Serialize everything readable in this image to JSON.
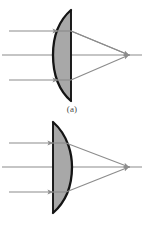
{
  "figure": {
    "background_color": "#ffffff",
    "width": 144,
    "height": 227,
    "colors": {
      "lens_fill": "#a8a8a8",
      "lens_outline": "#1a1a1a",
      "ray_line": "#8c8c8c",
      "axis_line": "#8c8c8c",
      "caption_text": "#4a4a4a"
    },
    "panels": [
      {
        "id": "a",
        "caption": "(a)",
        "lens_type": "plano-convex",
        "curved_side": "left",
        "flat_side": "right",
        "description": "Parallel rays enter the curved (convex) surface on the left and exit through the flat surface on the right, converging to a focal point on the optical axis.",
        "optical_axis_y": 55,
        "focal_point": {
          "x": 129,
          "y": 55
        },
        "lens": {
          "flat_edge_x": 71,
          "apex_x": 53,
          "top_y": 10,
          "bottom_y": 101
        },
        "rays": [
          {
            "name": "upper-ray",
            "incoming_y": 31,
            "entry_x": 58,
            "exit_x": 71,
            "arrow_in_x": 40,
            "arrow_out_x": 100
          },
          {
            "name": "axis-ray",
            "incoming_y": 55,
            "entry_x": 53,
            "exit_x": 71,
            "arrow_in_x": 0,
            "arrow_out_x": 0
          },
          {
            "name": "lower-ray",
            "incoming_y": 80,
            "entry_x": 58,
            "exit_x": 71,
            "arrow_in_x": 40,
            "arrow_out_x": 100
          }
        ]
      },
      {
        "id": "b",
        "caption": "(b)",
        "lens_type": "plano-convex",
        "curved_side": "right",
        "flat_side": "left",
        "description": "Parallel rays enter the flat surface on the left and exit through the curved (convex) surface on the right, converging to a focal point on the optical axis.",
        "optical_axis_y": 55,
        "focal_point": {
          "x": 129,
          "y": 55
        },
        "lens": {
          "flat_edge_x": 53,
          "apex_x": 72,
          "top_y": 10,
          "bottom_y": 101
        },
        "rays": [
          {
            "name": "upper-ray",
            "incoming_y": 31,
            "entry_x": 53,
            "exit_x": 66,
            "arrow_in_x": 40,
            "arrow_out_x": 100
          },
          {
            "name": "axis-ray",
            "incoming_y": 55,
            "entry_x": 53,
            "exit_x": 72,
            "arrow_in_x": 0,
            "arrow_out_x": 0
          },
          {
            "name": "lower-ray",
            "incoming_y": 80,
            "entry_x": 53,
            "exit_x": 66,
            "arrow_in_x": 40,
            "arrow_out_x": 100
          }
        ]
      }
    ]
  }
}
